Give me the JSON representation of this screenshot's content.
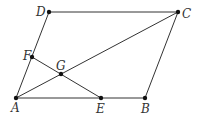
{
  "diagram": {
    "type": "geometry",
    "points": {
      "A": {
        "x": 16,
        "y": 98,
        "label": "A",
        "lx": 11,
        "ly": 112
      },
      "B": {
        "x": 145,
        "y": 98,
        "label": "B",
        "lx": 141,
        "ly": 113
      },
      "C": {
        "x": 178,
        "y": 12,
        "label": "C",
        "lx": 182,
        "ly": 18
      },
      "D": {
        "x": 49,
        "y": 12,
        "label": "D",
        "lx": 36,
        "ly": 16
      },
      "E": {
        "x": 101,
        "y": 98,
        "label": "E",
        "lx": 96,
        "ly": 113
      },
      "F": {
        "x": 32,
        "y": 57,
        "label": "F",
        "lx": 23,
        "ly": 60
      },
      "G": {
        "x": 61,
        "y": 74,
        "label": "G",
        "lx": 56,
        "ly": 70
      }
    },
    "segments": [
      [
        "A",
        "B"
      ],
      [
        "B",
        "C"
      ],
      [
        "C",
        "D"
      ],
      [
        "D",
        "A"
      ],
      [
        "A",
        "C"
      ],
      [
        "E",
        "F"
      ]
    ],
    "colors": {
      "line": "#333333",
      "point": "#111111",
      "label": "#333333",
      "background": "#ffffff"
    }
  }
}
